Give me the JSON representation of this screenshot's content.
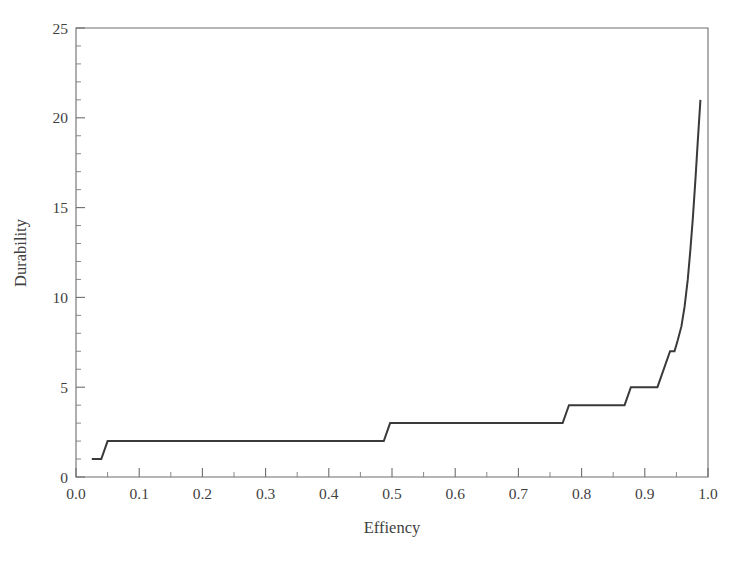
{
  "chart_data": {
    "type": "line",
    "title": "",
    "subtitle": "",
    "xlabel": "Effiency",
    "ylabel": "Durability",
    "xlim": [
      0.0,
      1.0
    ],
    "ylim": [
      0,
      25
    ],
    "grid": false,
    "legend": null,
    "line_color": "#3a3a3a",
    "background_color": "#ffffff",
    "axis_color": "#6d6d6d",
    "frame": "box",
    "x_ticks": [
      0.0,
      0.1,
      0.2,
      0.3,
      0.4,
      0.5,
      0.6,
      0.7,
      0.8,
      0.9,
      1.0
    ],
    "x_tick_labels": [
      "0.0",
      "0.1",
      "0.2",
      "0.3",
      "0.4",
      "0.5",
      "0.6",
      "0.7",
      "0.8",
      "0.9",
      "1.0"
    ],
    "x_minor_step": 0.05,
    "y_ticks": [
      0,
      5,
      10,
      15,
      20,
      25
    ],
    "y_tick_labels": [
      "0",
      "5",
      "10",
      "15",
      "20",
      "25"
    ],
    "y_minor_step": 1,
    "series": [
      {
        "name": "durability-step-curve",
        "style": "step-post",
        "x": [
          0.025,
          0.04,
          0.05,
          0.487,
          0.497,
          0.77,
          0.78,
          0.868,
          0.878,
          0.92,
          0.94,
          0.947,
          0.952,
          0.958,
          0.963,
          0.968,
          0.972,
          0.976,
          0.98,
          0.984,
          0.988
        ],
        "y": [
          1,
          1,
          2,
          2,
          3,
          3,
          4,
          4,
          5,
          5,
          7,
          7,
          7.6,
          8.4,
          9.5,
          11.0,
          12.6,
          14.4,
          16.5,
          18.8,
          21.0
        ]
      }
    ],
    "annotations": []
  },
  "figure": {
    "width": 746,
    "height": 564,
    "plot_area": {
      "left": 76,
      "right": 708,
      "top": 28,
      "bottom": 477
    }
  }
}
